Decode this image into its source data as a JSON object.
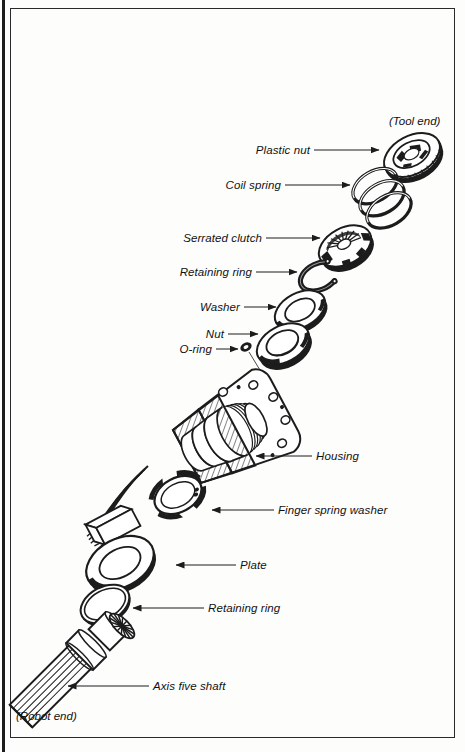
{
  "figure": {
    "type": "exploded-assembly-diagram",
    "orientation": "Tool end at upper right, Robot end at lower left"
  },
  "end_markers": [
    {
      "name": "tool-end",
      "text": "(Tool end)",
      "x": 389,
      "y": 122
    },
    {
      "name": "robot-end",
      "text": "(Robot end)",
      "x": 16,
      "y": 717
    }
  ],
  "callouts": [
    {
      "name": "plastic-nut",
      "label": "Plastic nut",
      "text_x": 310,
      "text_y": 150,
      "align": "r",
      "line_x1": 314,
      "line_y1": 150,
      "line_x2": 379,
      "line_y2": 150
    },
    {
      "name": "coil-spring",
      "label": "Coil spring",
      "text_x": 281,
      "text_y": 185,
      "align": "r",
      "line_x1": 285,
      "line_y1": 185,
      "line_x2": 350,
      "line_y2": 185
    },
    {
      "name": "serrated-clutch",
      "label": "Serrated clutch",
      "text_x": 262,
      "text_y": 238,
      "align": "r",
      "line_x1": 266,
      "line_y1": 238,
      "line_x2": 320,
      "line_y2": 238
    },
    {
      "name": "retaining-ring-top",
      "label": "Retaining ring",
      "text_x": 252,
      "text_y": 272,
      "align": "r",
      "line_x1": 256,
      "line_y1": 272,
      "line_x2": 297,
      "line_y2": 272
    },
    {
      "name": "washer",
      "label": "Washer",
      "text_x": 240,
      "text_y": 307,
      "align": "r",
      "line_x1": 244,
      "line_y1": 307,
      "line_x2": 276,
      "line_y2": 307
    },
    {
      "name": "nut",
      "label": "Nut",
      "text_x": 224,
      "text_y": 334,
      "align": "r",
      "line_x1": 228,
      "line_y1": 334,
      "line_x2": 258,
      "line_y2": 334
    },
    {
      "name": "o-ring",
      "label": "O-ring",
      "text_x": 212,
      "text_y": 349,
      "align": "r",
      "line_x1": 216,
      "line_y1": 349,
      "line_x2": 238,
      "line_y2": 349
    },
    {
      "name": "housing",
      "label": "Housing",
      "text_x": 316,
      "text_y": 456,
      "align": "l",
      "line_x1": 312,
      "line_y1": 456,
      "line_x2": 256,
      "line_y2": 456
    },
    {
      "name": "finger-spring-washer",
      "label": "Finger spring washer",
      "text_x": 278,
      "text_y": 510,
      "align": "l",
      "line_x1": 274,
      "line_y1": 510,
      "line_x2": 212,
      "line_y2": 510
    },
    {
      "name": "plate",
      "label": "Plate",
      "text_x": 240,
      "text_y": 565,
      "align": "l",
      "line_x1": 236,
      "line_y1": 565,
      "line_x2": 176,
      "line_y2": 565
    },
    {
      "name": "retaining-ring-bottom",
      "label": "Retaining ring",
      "text_x": 208,
      "text_y": 608,
      "align": "l",
      "line_x1": 204,
      "line_y1": 608,
      "line_x2": 133,
      "line_y2": 608
    },
    {
      "name": "axis-five-shaft",
      "label": "Axis five shaft",
      "text_x": 153,
      "text_y": 686,
      "align": "l",
      "line_x1": 149,
      "line_y1": 686,
      "line_x2": 68,
      "line_y2": 686
    }
  ],
  "parts_order": [
    "Plastic nut",
    "Coil spring",
    "Serrated clutch",
    "Retaining ring",
    "Washer",
    "Nut",
    "O-ring",
    "Housing",
    "Finger spring washer",
    "Plate",
    "Retaining ring",
    "Axis five shaft"
  ],
  "colors": {
    "ink": "#1c1c1c",
    "paper": "#fdfdfc",
    "frame": "#2a2a2a"
  }
}
